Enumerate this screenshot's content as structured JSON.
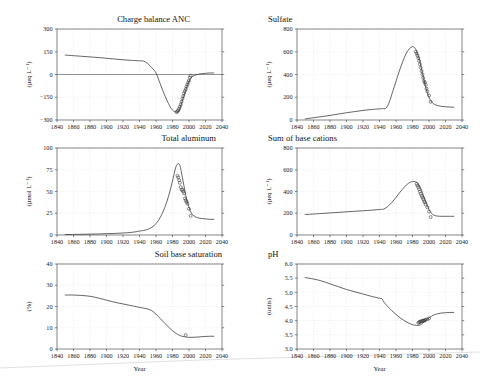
{
  "figure": {
    "background": "#ffffff",
    "shared_xlabel": "Year",
    "xlim": [
      1840,
      2040
    ],
    "xticks": [
      1840,
      1860,
      1880,
      1900,
      1920,
      1940,
      1960,
      1980,
      2000,
      2020,
      2040
    ],
    "curve_color": "#2a2a2a",
    "marker_style": "open-circle"
  },
  "chart_data": [
    {
      "type": "line",
      "panel": "top-left",
      "title": "Charge balance ANC",
      "xlabel": "Year",
      "ylabel": "(µeq L⁻¹)",
      "xlim": [
        1840,
        2040
      ],
      "ylim": [
        -300,
        300
      ],
      "xticks": [
        1840,
        1860,
        1880,
        1900,
        1920,
        1940,
        1960,
        1980,
        2000,
        2020,
        2040
      ],
      "yticks": [
        -300,
        -150,
        0,
        150,
        300
      ],
      "ytick_labels": [
        "−300",
        "−150",
        "0",
        "150",
        "300"
      ],
      "grid": true,
      "zero_reference_line": 0,
      "series": [
        {
          "name": "MAGIC simulation",
          "style": "line",
          "x": [
            1850,
            1860,
            1870,
            1880,
            1890,
            1900,
            1910,
            1920,
            1930,
            1940,
            1945,
            1950,
            1955,
            1960,
            1965,
            1970,
            1975,
            1980,
            1985,
            1988,
            1990,
            1992,
            1995,
            1998,
            2000,
            2003,
            2005,
            2010,
            2015,
            2020,
            2025,
            2030
          ],
          "y": [
            128,
            124,
            120,
            116,
            112,
            107,
            102,
            97,
            93,
            90,
            88,
            72,
            44,
            10,
            -60,
            -130,
            -190,
            -235,
            -248,
            -240,
            -210,
            -170,
            -120,
            -72,
            -45,
            -20,
            -10,
            0,
            5,
            8,
            10,
            10
          ]
        },
        {
          "name": "Observations",
          "style": "markers",
          "x": [
            1985,
            1986,
            1987,
            1988,
            1989,
            1990,
            1991,
            1992,
            1993,
            1994,
            1995,
            1996,
            1997,
            1998,
            1999,
            2000,
            2001,
            2002
          ],
          "y": [
            -248,
            -242,
            -236,
            -225,
            -212,
            -198,
            -180,
            -160,
            -142,
            -124,
            -110,
            -96,
            -80,
            -66,
            -52,
            -40,
            -20,
            -8
          ]
        }
      ]
    },
    {
      "type": "line",
      "panel": "top-right",
      "title": "Sulfate",
      "xlabel": "Year",
      "ylabel": "(µeq L⁻¹)",
      "xlim": [
        1840,
        2040
      ],
      "ylim": [
        0,
        800
      ],
      "xticks": [
        1840,
        1860,
        1880,
        1900,
        1920,
        1940,
        1960,
        1980,
        2000,
        2020,
        2040
      ],
      "yticks": [
        0,
        200,
        400,
        600,
        800
      ],
      "ytick_labels": [
        "0",
        "200",
        "400",
        "600",
        "800"
      ],
      "grid": true,
      "series": [
        {
          "name": "MAGIC simulation",
          "style": "line",
          "x": [
            1850,
            1860,
            1870,
            1880,
            1890,
            1900,
            1910,
            1920,
            1930,
            1940,
            1944,
            1948,
            1952,
            1956,
            1960,
            1964,
            1968,
            1972,
            1976,
            1980,
            1982,
            1984,
            1986,
            1988,
            1990,
            1992,
            1995,
            1998,
            2000,
            2003,
            2006,
            2010,
            2015,
            2020,
            2025,
            2030
          ],
          "y": [
            10,
            20,
            30,
            40,
            52,
            64,
            74,
            84,
            92,
            98,
            100,
            105,
            160,
            250,
            340,
            430,
            510,
            580,
            625,
            645,
            640,
            620,
            580,
            540,
            480,
            410,
            320,
            240,
            200,
            160,
            140,
            128,
            120,
            116,
            114,
            112
          ]
        },
        {
          "name": "Observations",
          "style": "markers",
          "x": [
            1984,
            1985,
            1986,
            1987,
            1988,
            1989,
            1990,
            1991,
            1992,
            1993,
            1994,
            1995,
            1996,
            1997,
            1998,
            2000,
            2002
          ],
          "y": [
            600,
            585,
            565,
            545,
            520,
            490,
            460,
            430,
            400,
            370,
            340,
            330,
            310,
            275,
            250,
            215,
            160
          ]
        }
      ]
    },
    {
      "type": "line",
      "panel": "middle-left",
      "title": "Total aluminum",
      "xlabel": "Year",
      "ylabel": "(µmol L⁻¹)",
      "xlim": [
        1840,
        2040
      ],
      "ylim": [
        0,
        100
      ],
      "xticks": [
        1840,
        1860,
        1880,
        1900,
        1920,
        1940,
        1960,
        1980,
        2000,
        2020,
        2040
      ],
      "yticks": [
        0,
        25,
        50,
        75,
        100
      ],
      "ytick_labels": [
        "0",
        "25",
        "50",
        "75",
        "100"
      ],
      "grid": true,
      "series": [
        {
          "name": "MAGIC simulation",
          "style": "line",
          "x": [
            1850,
            1870,
            1890,
            1910,
            1930,
            1940,
            1945,
            1950,
            1955,
            1960,
            1965,
            1970,
            1975,
            1980,
            1984,
            1987,
            1989,
            1990,
            1992,
            1994,
            1996,
            1998,
            2000,
            2003,
            2006,
            2010,
            2015,
            2020,
            2025,
            2030
          ],
          "y": [
            0.5,
            0.8,
            1.2,
            1.8,
            3.0,
            4.5,
            5.2,
            6.5,
            9.0,
            13.0,
            20.0,
            30.0,
            44.0,
            62.0,
            78.0,
            82.0,
            80.0,
            76.0,
            66.0,
            56.0,
            46.0,
            38.0,
            32.0,
            25.0,
            22.0,
            20.0,
            19.0,
            18.5,
            18.0,
            18.0
          ]
        },
        {
          "name": "Observations",
          "style": "markers",
          "x": [
            1986,
            1987,
            1988,
            1989,
            1990,
            1991,
            1992,
            1993,
            1994,
            1995,
            1996,
            1997,
            1998,
            2000,
            2002
          ],
          "y": [
            68,
            66,
            63,
            60,
            55,
            52,
            52,
            50,
            48,
            42,
            40,
            38,
            36,
            30,
            22
          ]
        }
      ]
    },
    {
      "type": "line",
      "panel": "middle-right",
      "title": "Sum of base cations",
      "xlabel": "Year",
      "ylabel": "(µeq L⁻¹)",
      "xlim": [
        1840,
        2040
      ],
      "ylim": [
        0,
        800
      ],
      "xticks": [
        1840,
        1860,
        1880,
        1900,
        1920,
        1940,
        1960,
        1980,
        2000,
        2020,
        2040
      ],
      "yticks": [
        0,
        200,
        400,
        600,
        800
      ],
      "ytick_labels": [
        "0",
        "200",
        "400",
        "600",
        "800"
      ],
      "grid": true,
      "series": [
        {
          "name": "MAGIC simulation",
          "style": "line",
          "x": [
            1850,
            1870,
            1890,
            1910,
            1930,
            1940,
            1945,
            1950,
            1955,
            1960,
            1965,
            1970,
            1975,
            1980,
            1984,
            1987,
            1990,
            1992,
            1995,
            1998,
            2000,
            2003,
            2006,
            2010,
            2015,
            2020,
            2025,
            2030
          ],
          "y": [
            188,
            198,
            208,
            218,
            228,
            235,
            238,
            262,
            300,
            345,
            395,
            440,
            475,
            492,
            488,
            470,
            430,
            390,
            330,
            270,
            235,
            200,
            182,
            174,
            172,
            172,
            172,
            172
          ]
        },
        {
          "name": "Observations",
          "style": "markers",
          "x": [
            1985,
            1986,
            1987,
            1988,
            1989,
            1990,
            1991,
            1992,
            1993,
            1994,
            1995,
            1996,
            1998,
            2000,
            2002
          ],
          "y": [
            470,
            455,
            440,
            420,
            400,
            380,
            360,
            345,
            330,
            310,
            300,
            280,
            255,
            215,
            165
          ]
        }
      ]
    },
    {
      "type": "line",
      "panel": "bottom-left",
      "title": "Soil base saturation",
      "xlabel": "Year",
      "ylabel": "(%)",
      "xlim": [
        1840,
        2040
      ],
      "ylim": [
        0,
        40
      ],
      "xticks": [
        1840,
        1860,
        1880,
        1900,
        1920,
        1940,
        1960,
        1980,
        2000,
        2020,
        2040
      ],
      "yticks": [
        0,
        10,
        20,
        30,
        40
      ],
      "ytick_labels": [
        "0",
        "10",
        "20",
        "30",
        "40"
      ],
      "grid": true,
      "series": [
        {
          "name": "MAGIC simulation",
          "style": "line",
          "x": [
            1850,
            1860,
            1870,
            1880,
            1890,
            1900,
            1910,
            1920,
            1930,
            1940,
            1950,
            1955,
            1960,
            1965,
            1970,
            1975,
            1980,
            1985,
            1990,
            1995,
            1997,
            2000,
            2005,
            2010,
            2015,
            2020,
            2025,
            2030
          ],
          "y": [
            25.4,
            25.4,
            25.2,
            24.8,
            24.0,
            23.0,
            22.0,
            21.2,
            20.4,
            19.6,
            18.8,
            18.0,
            16.4,
            14.4,
            12.4,
            10.4,
            8.6,
            7.2,
            6.2,
            5.7,
            5.6,
            5.5,
            5.5,
            5.6,
            5.8,
            5.9,
            6.0,
            6.0
          ]
        },
        {
          "name": "Observations",
          "style": "markers",
          "x": [
            1996
          ],
          "y": [
            6.6
          ]
        }
      ]
    },
    {
      "type": "line",
      "panel": "bottom-right",
      "title": "pH",
      "xlabel": "Year",
      "ylabel": "(units)",
      "xlim": [
        1840,
        2040
      ],
      "ylim": [
        3.0,
        6.0
      ],
      "xticks": [
        1840,
        1860,
        1880,
        1900,
        1920,
        1940,
        1960,
        1980,
        2000,
        2020,
        2040
      ],
      "yticks": [
        3.0,
        3.5,
        4.0,
        4.5,
        5.0,
        5.5,
        6.0
      ],
      "ytick_labels": [
        "3.0",
        "3.5",
        "4.0",
        "4.5",
        "5.0",
        "5.5",
        "6.0"
      ],
      "grid": true,
      "series": [
        {
          "name": "MAGIC simulation",
          "style": "line",
          "x": [
            1850,
            1860,
            1870,
            1880,
            1890,
            1900,
            1910,
            1920,
            1930,
            1940,
            1943,
            1946,
            1950,
            1955,
            1960,
            1965,
            1970,
            1975,
            1980,
            1985,
            1988,
            1990,
            1992,
            1995,
            1998,
            2000,
            2005,
            2010,
            2015,
            2020,
            2025,
            2030
          ],
          "y": [
            5.52,
            5.47,
            5.4,
            5.3,
            5.2,
            5.1,
            5.02,
            4.94,
            4.86,
            4.79,
            4.77,
            4.63,
            4.5,
            4.35,
            4.22,
            4.1,
            4.0,
            3.92,
            3.86,
            3.83,
            3.84,
            3.86,
            3.9,
            3.98,
            4.06,
            4.1,
            4.19,
            4.24,
            4.27,
            4.28,
            4.29,
            4.29
          ]
        },
        {
          "name": "Observations",
          "style": "markers",
          "x": [
            1987,
            1988,
            1989,
            1990,
            1991,
            1992,
            1993,
            1994,
            1995,
            1996,
            1998,
            2000
          ],
          "y": [
            3.92,
            3.95,
            3.96,
            3.97,
            3.98,
            3.99,
            4.0,
            4.0,
            4.02,
            4.03,
            4.05,
            4.08
          ]
        }
      ]
    }
  ]
}
